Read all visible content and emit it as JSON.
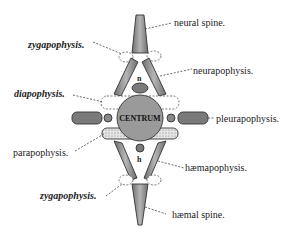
{
  "diagram": {
    "center_label": "CENTRUM",
    "canal_labels": {
      "neural": "n",
      "haemal": "h"
    },
    "labels": {
      "neural_spine": "neural spine.",
      "zygapophysis_upper": "zygapophysis.",
      "neurapophysis": "neurapophysis.",
      "diapophysis": "diapophysis.",
      "pleurapophysis": "pleurapophysis.",
      "parapophysis": "parapophysis.",
      "haemapophysis": "hæmapophysis.",
      "zygapophysis_lower": "zygapophysis.",
      "haemal_spine": "hæmal spine."
    },
    "colors": {
      "bone": "#8a8a8a",
      "bone_light": "#bdbdbd",
      "centrum": "#9a9a9a",
      "ink": "#222222",
      "background": "#ffffff"
    }
  }
}
